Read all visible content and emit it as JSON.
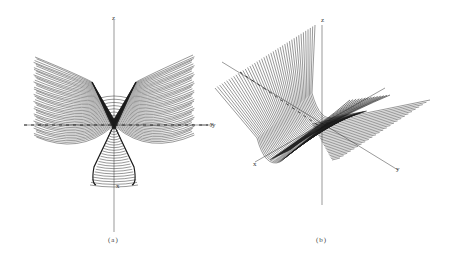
{
  "figure": {
    "panels": [
      {
        "id": "a",
        "caption": "(a)",
        "axes": {
          "z": "z",
          "y": "y",
          "x": "x"
        },
        "surface": {
          "line_count": 46,
          "origin": [
            114,
            125
          ],
          "top_y": 57,
          "left_x": 35,
          "right_x": 195,
          "cone_bottom_y": 180,
          "line_color": "#1a1a1a"
        }
      },
      {
        "id": "b",
        "caption": "(b)",
        "axes": {
          "z": "z",
          "y_left": "y",
          "x": "x",
          "y_right": "y"
        },
        "surface": {
          "line_count": 44,
          "origin": [
            322,
            128
          ],
          "line_color": "#1a1a1a"
        }
      }
    ],
    "colors": {
      "background": "#ffffff",
      "ink": "#1a1a1a",
      "axis": "#555555"
    }
  }
}
